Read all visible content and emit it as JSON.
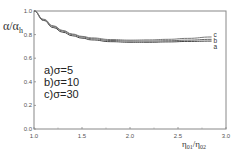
{
  "chart_data": {
    "type": "line",
    "title": "",
    "xlabel": "η01/η02",
    "ylabel": "α/αh",
    "xlim": [
      1.0,
      3.0
    ],
    "ylim": [
      0.0,
      1.0
    ],
    "xticks": [
      "1.0",
      "1.5",
      "2.0",
      "2.5",
      "3.0"
    ],
    "yticks": [
      "0.0",
      "0.2",
      "0.4",
      "0.6",
      "0.8",
      "1.0"
    ],
    "grid": false,
    "legend_position": "inside-center-left",
    "legend": [
      "a)σ=5",
      "b)σ=10",
      "c)σ=30"
    ],
    "curve_labels": [
      "c",
      "b",
      "a"
    ],
    "x": [
      1.0,
      1.1,
      1.2,
      1.3,
      1.4,
      1.5,
      1.6,
      1.8,
      2.0,
      2.2,
      2.4,
      2.6,
      2.85
    ],
    "series": [
      {
        "name": "a)σ=5",
        "values": [
          1.0,
          0.92,
          0.86,
          0.82,
          0.79,
          0.77,
          0.755,
          0.74,
          0.735,
          0.735,
          0.738,
          0.742,
          0.745
        ]
      },
      {
        "name": "b)σ=10",
        "values": [
          1.0,
          0.925,
          0.87,
          0.83,
          0.8,
          0.78,
          0.765,
          0.75,
          0.745,
          0.745,
          0.748,
          0.753,
          0.76
        ]
      },
      {
        "name": "c)σ=30",
        "values": [
          1.0,
          0.93,
          0.875,
          0.835,
          0.805,
          0.785,
          0.772,
          0.758,
          0.753,
          0.755,
          0.76,
          0.768,
          0.78
        ]
      }
    ]
  },
  "axes": {
    "xlabel_main": "η",
    "xlabel_sub1": "01",
    "xlabel_slash": "/η",
    "xlabel_sub2": "02",
    "ylabel_main": "α/α",
    "ylabel_sub": "h"
  }
}
